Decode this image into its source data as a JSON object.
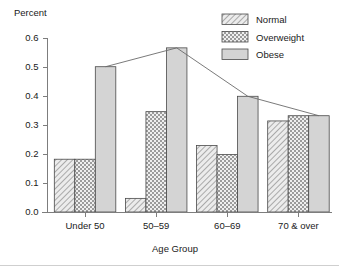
{
  "chart_data": {
    "type": "bar",
    "title": "",
    "xlabel": "Age Group",
    "ylabel": "Percent",
    "categories": [
      "Under 50",
      "50–59",
      "60–69",
      "70 & over"
    ],
    "series": [
      {
        "name": "Normal",
        "values": [
          0.182,
          0.047,
          0.229,
          0.314
        ],
        "fill": "#e8e8e8",
        "pattern": "diagonal-hatch"
      },
      {
        "name": "Overweight",
        "values": [
          0.182,
          0.346,
          0.198,
          0.332
        ],
        "fill": "#dcdcdc",
        "pattern": "checker-hatch"
      },
      {
        "name": "Obese",
        "values": [
          0.501,
          0.566,
          0.399,
          0.332
        ],
        "fill": "#d2d2d2",
        "pattern": "solid"
      }
    ],
    "overlay_line": {
      "name": "Obese trend",
      "x": [
        "Under 50",
        "50–59",
        "60–69",
        "70 & over"
      ],
      "values": [
        0.501,
        0.566,
        0.399,
        0.332
      ]
    },
    "ylim": [
      0.0,
      0.6
    ],
    "ytick_values": [
      0.0,
      0.1,
      0.2,
      0.3,
      0.4,
      0.5,
      0.6
    ],
    "ytick_labels": [
      "0.0",
      "0.1",
      "0.2",
      "0.3",
      "0.4",
      "0.5",
      "0.6"
    ],
    "grid": false,
    "legend_position": "top-right",
    "legend_entries": [
      "Normal",
      "Overweight",
      "Obese"
    ]
  },
  "axes": {
    "y_title": "Percent",
    "x_title": "Age Group"
  },
  "colors": {
    "background": "#ffffff",
    "axis": "#7d7d7d",
    "text": "#1a1a1a",
    "bar_outline": "#4a4a4a",
    "trend_line": "#6b6b6b"
  }
}
